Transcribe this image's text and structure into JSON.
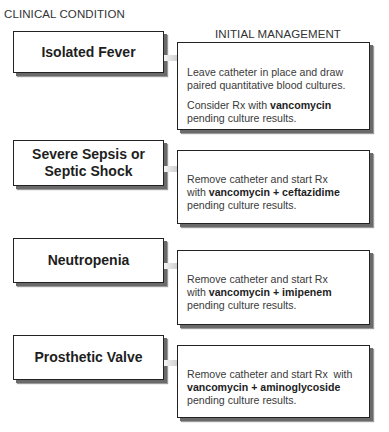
{
  "headers": {
    "left": "CLINICAL CONDITION",
    "right": "INITIAL MANAGEMENT"
  },
  "rows": [
    {
      "condition": "Isolated Fever",
      "management": {
        "p1": "Leave catheter in place and draw paired quantitative blood cultures.",
        "p2_pre": "Consider Rx with ",
        "p2_bold": "vancomycin",
        "p2_post": "pending culture results."
      }
    },
    {
      "condition_line1": "Severe Sepsis or",
      "condition_line2": "Septic Shock",
      "management": {
        "line1": "Remove catheter and start Rx",
        "pre": "with ",
        "bold": "vancomycin + ceftazidime",
        "post": "pending culture results."
      }
    },
    {
      "condition": "Neutropenia",
      "management": {
        "line1": "Remove catheter and start Rx",
        "pre": "with ",
        "bold": "vancomycin + imipenem",
        "post": "pending culture results."
      }
    },
    {
      "condition": "Prosthetic Valve",
      "management": {
        "line1": "Remove catheter and start Rx  with",
        "bold": "vancomycin + aminoglycoside",
        "post": "pending culture results."
      }
    }
  ],
  "colors": {
    "border": "#222222",
    "shadow": "#6a6a6a",
    "arrow_light": "#f2f2f2",
    "arrow_dark": "#6e6e6e"
  }
}
